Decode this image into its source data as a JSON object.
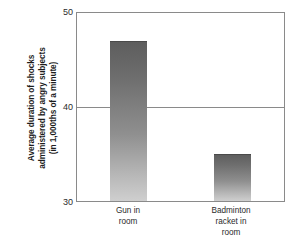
{
  "chart_data": {
    "type": "bar",
    "title": "",
    "subtitle": "",
    "xlabel": "",
    "ylabel": "Average duration of shocks administered by angry subjects (in 1,000ths of a minute)",
    "ylabel_lines": [
      "Average duration of shocks",
      "administered by angry subjects",
      "(in 1,000ths of a minute)"
    ],
    "categories": [
      "Gun in room",
      "Badminton racket in room"
    ],
    "category_lines": [
      [
        "Gun in",
        "room"
      ],
      [
        "Badminton",
        "racket in",
        "room"
      ]
    ],
    "values": [
      47,
      35
    ],
    "ylim": [
      30,
      50
    ],
    "yticks": [
      50,
      40,
      30
    ],
    "ytick_labels": [
      "50",
      "40",
      "30"
    ],
    "grid": "horizontal-at-40",
    "legend": "none",
    "bar_color_top": "#5d5d5d",
    "bar_color_bottom": "#cfcfcf",
    "axis_color": "#8a8a8a",
    "background": "#ffffff"
  }
}
